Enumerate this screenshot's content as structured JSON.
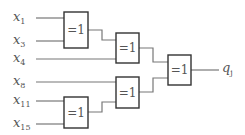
{
  "diagram": {
    "inputs": [
      {
        "var": "x",
        "sub": "1",
        "y": 18
      },
      {
        "var": "x",
        "sub": "3",
        "y": 41
      },
      {
        "var": "x",
        "sub": "4",
        "y": 59
      },
      {
        "var": "x",
        "sub": "8",
        "y": 82
      },
      {
        "var": "x",
        "sub": "11",
        "y": 101
      },
      {
        "var": "x",
        "sub": "15",
        "y": 124
      }
    ],
    "gates": [
      {
        "id": "g1",
        "label": "=1",
        "inputs": [
          "x_1",
          "x_3"
        ]
      },
      {
        "id": "g2",
        "label": "=1",
        "inputs": [
          "g1",
          "x_4"
        ]
      },
      {
        "id": "g3",
        "label": "=1",
        "inputs": [
          "x_8",
          "g5"
        ]
      },
      {
        "id": "g4",
        "label": "=1",
        "inputs": [
          "g2",
          "g3"
        ]
      },
      {
        "id": "g5",
        "label": "=1",
        "inputs": [
          "x_11",
          "x_15"
        ]
      }
    ],
    "output": {
      "var": "q",
      "sub": "j"
    }
  }
}
